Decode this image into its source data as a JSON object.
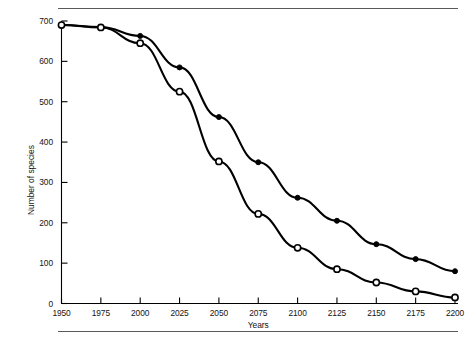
{
  "figure": {
    "has_top_rule": true,
    "has_bottom_rule": true,
    "rule_color": "#5a5a5a",
    "background": "#ffffff"
  },
  "axes": {
    "y_title": "Number of species",
    "x_title": "Years",
    "y_ticks": [
      "0",
      "100",
      "200",
      "300",
      "400",
      "500",
      "600",
      "700"
    ],
    "x_ticks": [
      "1950",
      "1975",
      "2000",
      "2025",
      "2050",
      "2075",
      "2100",
      "2125",
      "2150",
      "2175",
      "2200"
    ],
    "line_color": "#000000"
  },
  "chart_data": {
    "type": "line",
    "title": "",
    "xlabel": "Years",
    "ylabel": "Number of species",
    "xlim": [
      1950,
      2200
    ],
    "ylim": [
      0,
      700
    ],
    "xticks": [
      1950,
      1975,
      2000,
      2025,
      2050,
      2075,
      2100,
      2125,
      2150,
      2175,
      2200
    ],
    "yticks": [
      0,
      100,
      200,
      300,
      400,
      500,
      600,
      700
    ],
    "grid": false,
    "legend_position": "none",
    "x": [
      1950,
      1975,
      2000,
      2025,
      2050,
      2075,
      2100,
      2125,
      2150,
      2175,
      2200
    ],
    "series": [
      {
        "name": "filled-circles-series",
        "marker": "filled-circle",
        "color": "#000000",
        "values": [
          690,
          685,
          663,
          585,
          462,
          350,
          262,
          205,
          147,
          110,
          80
        ]
      },
      {
        "name": "open-circles-series",
        "marker": "open-circle",
        "color": "#000000",
        "values": [
          690,
          684,
          645,
          525,
          352,
          222,
          138,
          85,
          52,
          30,
          15
        ]
      }
    ]
  }
}
